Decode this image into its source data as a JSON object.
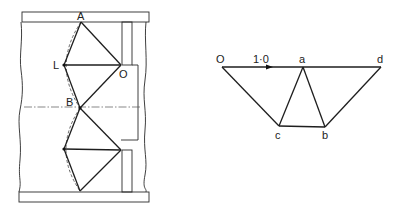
{
  "diagram": {
    "type": "mechanism-and-velocity-diagram",
    "left_figure": {
      "name": "linkage-mechanism",
      "labels": {
        "A": "A",
        "L": "L",
        "O": "O",
        "B": "B"
      },
      "points": {
        "A": [
          81,
          22
        ],
        "L": [
          64,
          65
        ],
        "O": [
          121,
          65
        ],
        "B": [
          80,
          108
        ],
        "L2": [
          64,
          149
        ],
        "O2": [
          121,
          150
        ],
        "D": [
          80,
          191
        ]
      },
      "frame": {
        "top_bar": {
          "x": 22,
          "y": 12,
          "w": 127,
          "h": 10
        },
        "bottom_bar": {
          "x": 19,
          "y": 192,
          "w": 130,
          "h": 10
        },
        "top_post": {
          "x": 122,
          "y": 22,
          "w": 10,
          "h": 43
        },
        "bottom_post": {
          "x": 122,
          "y": 150,
          "w": 10,
          "h": 42
        },
        "centerline_y": 107
      }
    },
    "right_figure": {
      "name": "velocity-diagram",
      "labels": {
        "O": "O",
        "a": "a",
        "d": "d",
        "c": "c",
        "b": "b",
        "scale": "1·0"
      },
      "points": {
        "O": [
          222,
          67
        ],
        "a": [
          303,
          67
        ],
        "d": [
          381,
          67
        ],
        "c": [
          279,
          126
        ],
        "b": [
          325,
          127
        ]
      },
      "edges": [
        [
          "O",
          "a"
        ],
        [
          "a",
          "d"
        ],
        [
          "O",
          "c"
        ],
        [
          "c",
          "a"
        ],
        [
          "a",
          "b"
        ],
        [
          "c",
          "b"
        ],
        [
          "b",
          "d"
        ]
      ],
      "arrow_on": [
        "O",
        "a"
      ]
    }
  }
}
